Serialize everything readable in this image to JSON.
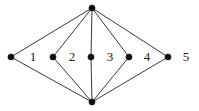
{
  "figure": {
    "background_color": "#ffffff",
    "width": 199,
    "height": 111
  },
  "style": {
    "edge_color": "#3a3a3a",
    "edge_width": 1,
    "vertex_color": "#111111",
    "vertex_radius": 3.1,
    "label_color": "#1a1a1a",
    "label_font_size": 13
  },
  "graph": {
    "vertex_count": 6,
    "edge_count": 8,
    "vertices": [
      {
        "id": "top",
        "name": "apex-top-vertex",
        "x": 92,
        "y": 8
      },
      {
        "id": "bottom",
        "name": "apex-bottom-vertex",
        "x": 92,
        "y": 102
      },
      {
        "id": "m1",
        "name": "middle-vertex-left",
        "x": 11,
        "y": 57
      },
      {
        "id": "m2",
        "name": "middle-vertex-two",
        "x": 53,
        "y": 57
      },
      {
        "id": "m3",
        "name": "middle-vertex-center",
        "x": 91,
        "y": 57
      },
      {
        "id": "m4",
        "name": "middle-vertex-four",
        "x": 129,
        "y": 57
      },
      {
        "id": "m5",
        "name": "middle-vertex-right",
        "x": 168,
        "y": 57
      }
    ],
    "edges": [
      {
        "from": "top",
        "to": "m1",
        "name": "edge-top-left"
      },
      {
        "from": "top",
        "to": "m2",
        "name": "edge-top-two"
      },
      {
        "from": "top",
        "to": "m3",
        "name": "edge-top-center"
      },
      {
        "from": "top",
        "to": "m4",
        "name": "edge-top-four"
      },
      {
        "from": "top",
        "to": "m5",
        "name": "edge-top-right"
      },
      {
        "from": "bottom",
        "to": "m1",
        "name": "edge-bottom-left"
      },
      {
        "from": "bottom",
        "to": "m2",
        "name": "edge-bottom-two"
      },
      {
        "from": "bottom",
        "to": "m3",
        "name": "edge-bottom-center"
      },
      {
        "from": "bottom",
        "to": "m4",
        "name": "edge-bottom-four"
      },
      {
        "from": "bottom",
        "to": "m5",
        "name": "edge-bottom-right"
      }
    ]
  },
  "face_labels": [
    {
      "text": "1",
      "x": 33,
      "y": 58,
      "name": "face-label-1"
    },
    {
      "text": "2",
      "x": 72,
      "y": 58,
      "name": "face-label-2"
    },
    {
      "text": "3",
      "x": 110,
      "y": 58,
      "name": "face-label-3"
    },
    {
      "text": "4",
      "x": 147,
      "y": 58,
      "name": "face-label-4"
    },
    {
      "text": "5",
      "x": 186,
      "y": 58,
      "name": "face-label-5"
    }
  ]
}
